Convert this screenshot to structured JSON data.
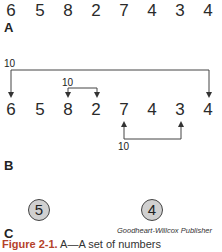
{
  "panel_a": {
    "label": "A",
    "numbers": [
      "6",
      "5",
      "8",
      "2",
      "7",
      "4",
      "3",
      "4"
    ]
  },
  "panel_b": {
    "label": "B",
    "numbers": [
      "6",
      "5",
      "8",
      "2",
      "7",
      "4",
      "3",
      "4"
    ],
    "connectors": [
      {
        "from_index": 0,
        "to_index": 7,
        "sum": "10",
        "position": "top-outer"
      },
      {
        "from_index": 2,
        "to_index": 3,
        "sum": "10",
        "position": "top-inner"
      },
      {
        "from_index": 4,
        "to_index": 6,
        "sum": "10",
        "position": "bottom"
      }
    ]
  },
  "panel_c": {
    "label": "C",
    "circles": [
      "5",
      "4"
    ]
  },
  "credit": "Goodheart-Willcox Publisher",
  "caption": {
    "figure_label": "Figure 2-1.",
    "text": " A—A set of numbers"
  }
}
